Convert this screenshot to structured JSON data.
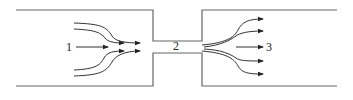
{
  "diagram": {
    "labels": {
      "section1": "1",
      "section2": "2",
      "section3": "3"
    },
    "colors": {
      "stroke": "#555555",
      "arrow": "#222222"
    }
  }
}
